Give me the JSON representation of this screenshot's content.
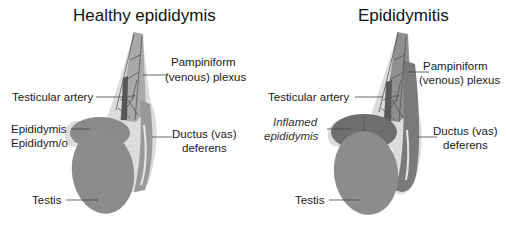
{
  "panels": [
    {
      "title": "Healthy epididymis",
      "labels": {
        "pampiniform_1": "Pampiniform",
        "pampiniform_2": "(venous) plexus",
        "testicular_artery": "Testicular artery",
        "epididymis_1": "Epididymis",
        "epididymis_2": "Epididym/o",
        "ductus_1": "Ductus (vas)",
        "ductus_2": "deferens",
        "testis": "Testis"
      }
    },
    {
      "title": "Epididymitis",
      "labels": {
        "pampiniform_1": "Pampiniform",
        "pampiniform_2": "(venous) plexus",
        "testicular_artery": "Testicular artery",
        "epididymis_1": "Inflamed",
        "epididymis_2": "epididymis",
        "ductus_1": "Ductus (vas)",
        "ductus_2": "deferens",
        "testis": "Testis"
      }
    }
  ],
  "colors": {
    "testis": "#8c8c8c",
    "epididymis_healthy": "#8a8a8a",
    "epididymis_inflamed": "#6e6e6e",
    "sheath": "#d9d9d9",
    "cord": "#a6a6a6",
    "vessels": "#555555",
    "artery": "#5a5a5a",
    "leader": "#444444"
  }
}
